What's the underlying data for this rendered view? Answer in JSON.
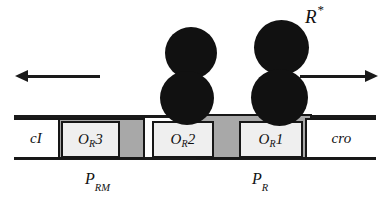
{
  "figure": {
    "annotation": {
      "symbol": "R",
      "superscript": "*"
    }
  },
  "dna": {
    "genes": [
      {
        "id": "cI",
        "name": "cI",
        "italic": true
      },
      {
        "id": "cro",
        "name": "cro",
        "italic": true
      }
    ],
    "operators": [
      {
        "id": "OR3",
        "base": "O",
        "sub": "R",
        "num": "3",
        "occupied": false
      },
      {
        "id": "OR2",
        "base": "O",
        "sub": "R",
        "num": "2",
        "occupied": true
      },
      {
        "id": "OR1",
        "base": "O",
        "sub": "R",
        "num": "1",
        "occupied": true
      }
    ]
  },
  "promoters": [
    {
      "id": "PRM",
      "base": "P",
      "sub": "RM",
      "direction": "leftward"
    },
    {
      "id": "PR",
      "base": "P",
      "sub": "R",
      "direction": "rightward"
    }
  ],
  "arrows": [
    {
      "id": "leftward-transcription",
      "direction": "left"
    },
    {
      "id": "rightward-transcription",
      "direction": "right"
    }
  ],
  "repressors": [
    {
      "id": "dimer-or2",
      "bound_to": "OR2",
      "subunits": 2
    },
    {
      "id": "dimer-or1",
      "bound_to": "OR1",
      "subunits": 2
    }
  ],
  "colors": {
    "outline": "#171717",
    "promoter_fill": "#a8a8a8",
    "operator_fill": "#efefef",
    "gene_fill": "#ffffff",
    "protein_fill": "#111111"
  }
}
